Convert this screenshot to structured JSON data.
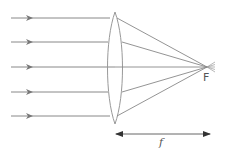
{
  "diagram": {
    "labels": {
      "focal_point": "F",
      "focal_length": "f"
    },
    "colors": {
      "ray": "#888888",
      "lens": "#999999",
      "arrow": "#333333"
    },
    "rays_y": [
      18,
      42,
      67,
      92,
      116
    ],
    "lens": {
      "x": 115,
      "top": 12,
      "bottom": 124
    },
    "focal_point": {
      "x": 207,
      "y": 67
    }
  }
}
